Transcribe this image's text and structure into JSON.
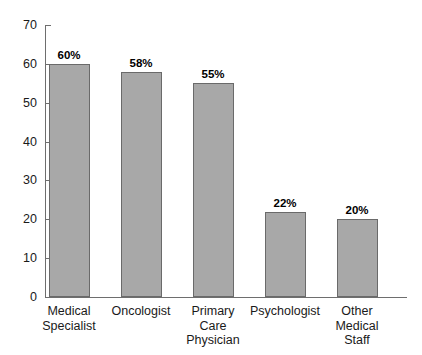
{
  "chart_data": {
    "type": "bar",
    "title": "",
    "subtitle": "",
    "xlabel": "",
    "ylabel": "",
    "ylim": [
      0,
      70
    ],
    "yticks": [
      0,
      10,
      20,
      30,
      40,
      50,
      60,
      70
    ],
    "grid": false,
    "legend": false,
    "value_label_suffix": "%",
    "categories": [
      "Medical Specialist",
      "Oncologist",
      "Primary Care Physician",
      "Psychologist",
      "Other Medical Staff"
    ],
    "category_lines": [
      [
        "Medical",
        "Specialist"
      ],
      [
        "Oncologist"
      ],
      [
        "Primary",
        "Care",
        "Physician"
      ],
      [
        "Psychologist"
      ],
      [
        "Other",
        "Medical",
        "Staff"
      ]
    ],
    "values": [
      60,
      58,
      55,
      22,
      20
    ],
    "value_labels": [
      "60%",
      "58%",
      "55%",
      "22%",
      "20%"
    ],
    "colors": {
      "bar_fill": "#a8a8a8",
      "bar_border": "#6a6a6a",
      "axis": "#6e6e6e",
      "text": "#1a1a1a",
      "background": "#ffffff"
    }
  }
}
